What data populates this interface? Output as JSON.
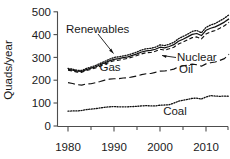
{
  "chart_data": {
    "type": "line",
    "title": "",
    "xlabel": "",
    "ylabel": "Quads/year",
    "xlim": [
      1979,
      2015
    ],
    "ylim": [
      0,
      500
    ],
    "grid": false,
    "legend_position": "inline-annotations",
    "xticks": [
      1980,
      1990,
      2000,
      2010
    ],
    "xminorticks": [
      1985,
      1995,
      2005,
      2015
    ],
    "yticks": [
      0,
      100,
      200,
      300,
      400,
      500
    ],
    "x": [
      1980,
      1981,
      1982,
      1983,
      1984,
      1985,
      1986,
      1987,
      1988,
      1989,
      1990,
      1991,
      1992,
      1993,
      1994,
      1995,
      1996,
      1997,
      1998,
      1999,
      2000,
      2001,
      2002,
      2003,
      2004,
      2005,
      2006,
      2007,
      2008,
      2009,
      2010,
      2011,
      2012,
      2013,
      2014,
      2015
    ],
    "series": [
      {
        "name": "Renewables",
        "style": "dotted",
        "values": [
          252,
          249,
          244,
          243,
          252,
          258,
          265,
          274,
          283,
          292,
          300,
          303,
          307,
          311,
          317,
          324,
          333,
          338,
          340,
          345,
          355,
          352,
          358,
          366,
          382,
          392,
          402,
          414,
          418,
          408,
          432,
          442,
          449,
          460,
          472,
          487
        ]
      },
      {
        "name": "Nuclear",
        "style": "solid",
        "values": [
          248,
          245,
          240,
          239,
          247,
          253,
          259,
          268,
          277,
          285,
          292,
          295,
          299,
          303,
          309,
          316,
          324,
          329,
          331,
          336,
          345,
          342,
          348,
          356,
          371,
          380,
          390,
          401,
          405,
          396,
          419,
          428,
          434,
          444,
          455,
          469
        ]
      },
      {
        "name": "Gas",
        "style": "dashed",
        "values": [
          244,
          241,
          236,
          235,
          243,
          248,
          254,
          262,
          271,
          279,
          286,
          288,
          292,
          296,
          302,
          309,
          316,
          321,
          322,
          327,
          336,
          332,
          338,
          345,
          359,
          368,
          377,
          387,
          390,
          381,
          403,
          412,
          418,
          428,
          439,
          454
        ]
      },
      {
        "name": "Oil",
        "style": "longdash",
        "values": [
          190,
          186,
          181,
          179,
          184,
          185,
          190,
          195,
          201,
          205,
          207,
          207,
          210,
          211,
          215,
          219,
          225,
          229,
          230,
          235,
          240,
          241,
          244,
          249,
          259,
          263,
          266,
          271,
          268,
          262,
          272,
          277,
          280,
          287,
          295,
          314
        ]
      },
      {
        "name": "Coal",
        "style": "dotted",
        "values": [
          65,
          66,
          66,
          68,
          72,
          74,
          76,
          79,
          82,
          84,
          85,
          84,
          84,
          84,
          85,
          86,
          88,
          89,
          88,
          88,
          91,
          92,
          93,
          100,
          108,
          113,
          117,
          121,
          122,
          118,
          127,
          133,
          131,
          130,
          131,
          130
        ]
      }
    ],
    "annotations": [
      {
        "text": "Renewables",
        "kind": "leader-arrow",
        "points_to_year": 1990
      },
      {
        "text": "Nuclear",
        "kind": "leader-line",
        "points_to_year": 2001
      },
      {
        "text": "Gas",
        "kind": "inline"
      },
      {
        "text": "Oil",
        "kind": "inline"
      },
      {
        "text": "Coal",
        "kind": "inline"
      }
    ]
  },
  "axes": {
    "y_title": "Quads/year",
    "y_tick_labels": [
      "500",
      "400",
      "300",
      "200",
      "100",
      "0"
    ],
    "x_tick_labels": [
      "1980",
      "1990",
      "2000",
      "2010"
    ]
  },
  "labels": {
    "renewables": "Renewables",
    "nuclear": "Nuclear",
    "gas": "Gas",
    "oil": "Oil",
    "coal": "Coal"
  },
  "colors": {
    "axis": "#4d4d4d",
    "curve": "#111111",
    "text": "#1a1a1a",
    "background": "#ffffff"
  }
}
